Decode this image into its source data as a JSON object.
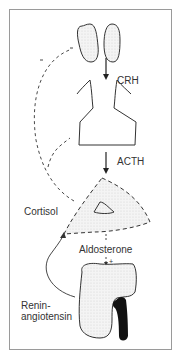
{
  "labels": {
    "crh": "CRH",
    "acth": "ACTH",
    "cortisol": "Cortisol",
    "aldosterone": "Aldosterone",
    "renin_line1": "Renin-",
    "renin_line2": "angiotensin",
    "plus_sign": "+"
  },
  "colors": {
    "outline": "#333333",
    "fill_stipple": "#ededed",
    "kidney_vessel": "#111111",
    "frame": "#9a9a9a"
  }
}
